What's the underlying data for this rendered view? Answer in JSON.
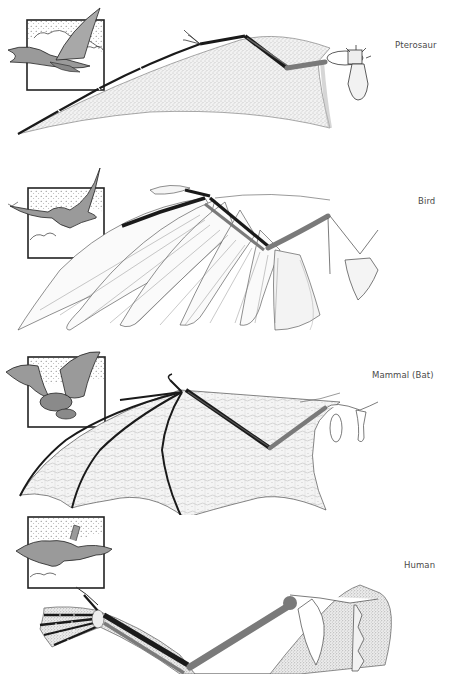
{
  "figure": {
    "panels": [
      {
        "id": "pterosaur",
        "label": "Pterosaur"
      },
      {
        "id": "bird",
        "label": "Bird"
      },
      {
        "id": "bat",
        "label": "Mammal (Bat)"
      },
      {
        "id": "human",
        "label": "Human"
      }
    ],
    "colors": {
      "bone_dark": "#1a1a1a",
      "bone_gray": "#7a7a7a",
      "membrane_stipple": "#d9d9d9",
      "inset_fill": "#9a9a9a",
      "outline": "#222222"
    }
  }
}
